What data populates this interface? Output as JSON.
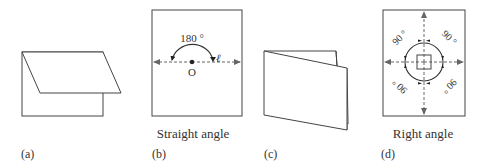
{
  "panels": [
    {
      "id": "a",
      "label": "(a)",
      "caption": ""
    },
    {
      "id": "b",
      "label": "(b)",
      "caption": "Straight angle",
      "angle_label": "180 °",
      "point_label": "O",
      "line_label": "ℓ"
    },
    {
      "id": "c",
      "label": "(c)",
      "caption": ""
    },
    {
      "id": "d",
      "label": "(d)",
      "caption": "Right angle",
      "angle_labels": [
        "90 °",
        "90 °",
        "90 °",
        "90 °"
      ]
    }
  ],
  "colors": {
    "stroke": "#444444",
    "dashed": "#666666",
    "text": "#333333"
  }
}
